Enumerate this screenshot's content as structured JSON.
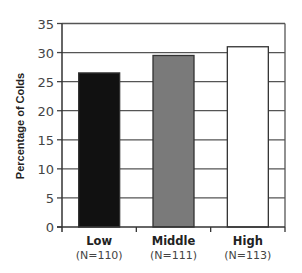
{
  "chart_data": {
    "type": "bar",
    "title": "",
    "xlabel": "",
    "ylabel": "Percentage of Colds",
    "categories": [
      "Low",
      "Middle",
      "High"
    ],
    "category_sublabels": [
      "(N=110)",
      "(N=111)",
      "(N=113)"
    ],
    "values": [
      26.5,
      29.5,
      31
    ],
    "bar_colors": [
      "#111111",
      "#7a7a7a",
      "#ffffff"
    ],
    "ylim": [
      0,
      35
    ],
    "yticks": [
      0,
      5,
      10,
      15,
      20,
      25,
      30,
      35
    ],
    "grid": true,
    "legend": null
  }
}
